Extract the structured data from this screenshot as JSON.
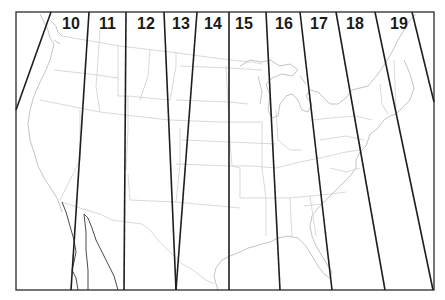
{
  "map": {
    "title": "UTM zones of the contiguous United States",
    "frame": {
      "left": 16,
      "top": 12,
      "right": 434,
      "bottom": 290
    },
    "colors": {
      "zone_line": "#1e1e1e",
      "frame": "#2a2a2a",
      "state_border": "#cfcfcf",
      "label": "#1a1a1a",
      "background": "#ffffff"
    },
    "zones": [
      {
        "label": "10",
        "label_x": 62,
        "label_y": 29
      },
      {
        "label": "11",
        "label_x": 99,
        "label_y": 29
      },
      {
        "label": "12",
        "label_x": 137,
        "label_y": 29
      },
      {
        "label": "13",
        "label_x": 172,
        "label_y": 29
      },
      {
        "label": "14",
        "label_x": 204,
        "label_y": 29
      },
      {
        "label": "15",
        "label_x": 235,
        "label_y": 29
      },
      {
        "label": "16",
        "label_x": 275,
        "label_y": 29
      },
      {
        "label": "17",
        "label_x": 310,
        "label_y": 29
      },
      {
        "label": "18",
        "label_x": 346,
        "label_y": 29
      },
      {
        "label": "19",
        "label_x": 390,
        "label_y": 29
      }
    ],
    "zone_boundaries": [
      {
        "x1": 51,
        "y1": 12,
        "x2": 16,
        "y2": 110
      },
      {
        "x1": 89,
        "y1": 12,
        "x2": 71,
        "y2": 290
      },
      {
        "x1": 126,
        "y1": 12,
        "x2": 124,
        "y2": 290
      },
      {
        "x1": 164,
        "y1": 12,
        "x2": 176,
        "y2": 290
      },
      {
        "x1": 197,
        "y1": 12,
        "x2": 176,
        "y2": 290
      },
      {
        "x1": 229,
        "y1": 12,
        "x2": 229,
        "y2": 290
      },
      {
        "x1": 266,
        "y1": 12,
        "x2": 280,
        "y2": 290
      },
      {
        "x1": 300,
        "y1": 12,
        "x2": 332,
        "y2": 290
      },
      {
        "x1": 336,
        "y1": 12,
        "x2": 385,
        "y2": 290
      },
      {
        "x1": 375,
        "y1": 12,
        "x2": 433,
        "y2": 290
      },
      {
        "x1": 412,
        "y1": 12,
        "x2": 434,
        "y2": 102
      }
    ]
  }
}
